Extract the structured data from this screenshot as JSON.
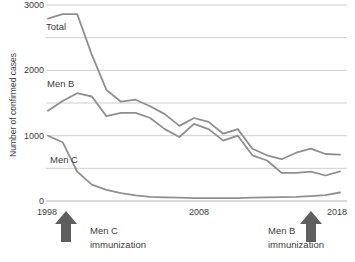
{
  "chart_data": {
    "type": "line",
    "title": "",
    "xlabel": "",
    "ylabel": "Number of confirmed cases",
    "ylim": [
      0,
      3000
    ],
    "xlim": [
      1998,
      2018
    ],
    "grid": "horizontal lines every 500",
    "legend": "inline labels next to lines",
    "ytick_labels": [
      "3000",
      "2000",
      "1000",
      "0"
    ],
    "yticks": [
      3000,
      2000,
      1000,
      0
    ],
    "xtick_labels": [
      "1998",
      "2008",
      "2018"
    ],
    "xticks": [
      1998,
      2008,
      2018
    ],
    "x": [
      1998,
      1999,
      2000,
      2001,
      2002,
      2003,
      2004,
      2005,
      2006,
      2007,
      2008,
      2009,
      2010,
      2011,
      2012,
      2013,
      2014,
      2015,
      2016,
      2017,
      2018
    ],
    "series": [
      {
        "name": "Total",
        "values": [
          2790,
          2860,
          2860,
          2240,
          1700,
          1520,
          1550,
          1450,
          1330,
          1150,
          1270,
          1210,
          1030,
          1100,
          800,
          700,
          640,
          740,
          800,
          720,
          710
        ]
      },
      {
        "name": "Men B",
        "values": [
          1380,
          1530,
          1650,
          1600,
          1300,
          1350,
          1350,
          1270,
          1100,
          980,
          1180,
          1100,
          925,
          1000,
          700,
          620,
          430,
          430,
          450,
          390,
          455
        ]
      },
      {
        "name": "Men C",
        "values": [
          1000,
          900,
          450,
          250,
          170,
          120,
          85,
          65,
          55,
          50,
          45,
          45,
          45,
          45,
          50,
          55,
          60,
          65,
          75,
          90,
          130
        ]
      }
    ],
    "annotations": [
      {
        "text": "Men C immunization",
        "line1": "Men C",
        "line2": "immunization",
        "x": 1999,
        "marker": "up-arrow"
      },
      {
        "text": "Men B immunization",
        "line1": "Men B",
        "line2": "immunization",
        "x": 2016,
        "marker": "up-arrow"
      }
    ],
    "colors": {
      "line": "#8f8f8f",
      "grid": "#cdcdcd",
      "axis_line": "#b3b3b3",
      "arrow": "#5e5e5e",
      "text": "#3d3d3d"
    }
  }
}
